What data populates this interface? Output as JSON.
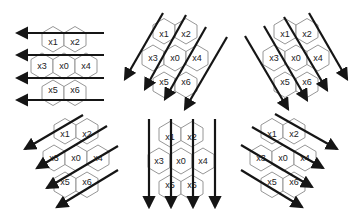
{
  "diagram": {
    "cell_labels": [
      "x0",
      "x1",
      "x2",
      "x3",
      "x4",
      "x5",
      "x6"
    ],
    "panels": [
      {
        "id": "p1",
        "position": "top-left",
        "arrow_direction": "left",
        "arrow_count": 4
      },
      {
        "id": "p2",
        "position": "top-middle",
        "arrow_direction": "down-left (steep)",
        "arrow_count": 4
      },
      {
        "id": "p3",
        "position": "top-right",
        "arrow_direction": "down-right (steep)",
        "arrow_count": 4
      },
      {
        "id": "p4",
        "position": "bottom-left",
        "arrow_direction": "down-left (shallow)",
        "arrow_count": 4
      },
      {
        "id": "p5",
        "position": "bottom-middle",
        "arrow_direction": "down",
        "arrow_count": 4
      },
      {
        "id": "p6",
        "position": "bottom-right",
        "arrow_direction": "down-right (shallow)",
        "arrow_count": 4
      }
    ],
    "colors": {
      "arrow": "#151515",
      "hex_stroke": "#8a8a8a",
      "background": "#ffffff"
    }
  }
}
